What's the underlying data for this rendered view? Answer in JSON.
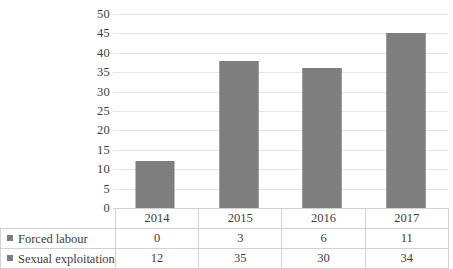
{
  "chart_data": {
    "type": "bar",
    "subtype": "stacked-column",
    "title": "",
    "xlabel": "",
    "ylabel": "",
    "categories": [
      "2014",
      "2015",
      "2016",
      "2017"
    ],
    "series": [
      {
        "name": "Forced labour",
        "values": [
          0,
          3,
          6,
          11
        ],
        "color": "#7e7e7e"
      },
      {
        "name": "Sexual exploitation",
        "values": [
          12,
          35,
          30,
          34
        ],
        "color": "#7e7e7e"
      }
    ],
    "totals": [
      12,
      38,
      36,
      45
    ],
    "ylim": [
      0,
      50
    ],
    "ytick_step": 5,
    "yticks": [
      "50",
      "45",
      "40",
      "35",
      "30",
      "25",
      "20",
      "15",
      "10",
      "5",
      "0"
    ],
    "grid": true,
    "legend_position": "table-left-column",
    "data_table_visible": true
  },
  "table": {
    "header_row": [
      "2014",
      "2015",
      "2016",
      "2017"
    ],
    "rows": [
      {
        "label": "Forced labour",
        "marker": "legend-square-icon",
        "values": [
          "0",
          "3",
          "6",
          "11"
        ]
      },
      {
        "label": "Sexual exploitation",
        "marker": "legend-square-icon",
        "values": [
          "12",
          "35",
          "30",
          "34"
        ]
      }
    ]
  },
  "colors": {
    "bar": "#7e7e7e",
    "gridline": "#e4e4e4",
    "table_border": "#d2d2d2",
    "text": "#3d3d3d",
    "background": "#ffffff"
  }
}
